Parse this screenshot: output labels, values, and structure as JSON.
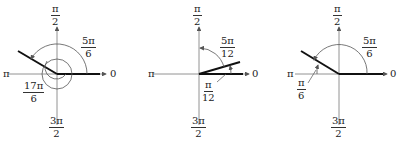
{
  "diagrams": [
    {
      "axis_labels": {
        "top_num": "π",
        "top_den": "2",
        "left": "π",
        "right": "0",
        "bottom_num": "3π",
        "bottom_den": "2"
      },
      "angle_label": {
        "num": "5π",
        "den": "6"
      },
      "extra_label": {
        "num": "17π",
        "den": "6"
      }
    },
    {
      "axis_labels": {
        "top_num": "π",
        "top_den": "2",
        "left": "π",
        "right": "0",
        "bottom_num": "3π",
        "bottom_den": "2"
      },
      "angle_label": {
        "num": "5π",
        "den": "12"
      },
      "extra_label": {
        "num": "π",
        "den": "12"
      }
    },
    {
      "axis_labels": {
        "top_num": "π",
        "top_den": "2",
        "left": "π",
        "right": "0",
        "bottom_num": "3π",
        "bottom_den": "2"
      },
      "angle_label": {
        "num": "5π",
        "den": "6"
      },
      "extra_label": {
        "num": "π",
        "den": "6"
      }
    }
  ]
}
